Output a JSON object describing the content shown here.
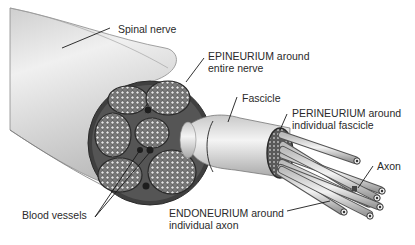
{
  "diagram": {
    "colors": {
      "background": "#ffffff",
      "nerve_body": "#d9d9d9",
      "nerve_highlight": "#f2f2f2",
      "cross_section": "#4a4a4a",
      "fascicle_fill": "#8c8c8c",
      "label_text": "#2a2a2a",
      "leader_line": "#1a1a1a"
    },
    "labels": {
      "spinal_nerve": {
        "line1": "Spinal nerve"
      },
      "epineurium": {
        "line1": "EPINEURIUM around",
        "line2": "entire nerve"
      },
      "fascicle": {
        "line1": "Fascicle"
      },
      "perineurium": {
        "line1": "PERINEURIUM around",
        "line2": "individual fascicle"
      },
      "axon": {
        "line1": "Axon"
      },
      "blood_vessels": {
        "line1": "Blood vessels"
      },
      "endoneurium": {
        "line1": "ENDONEURIUM around",
        "line2": "individual axon"
      }
    }
  }
}
